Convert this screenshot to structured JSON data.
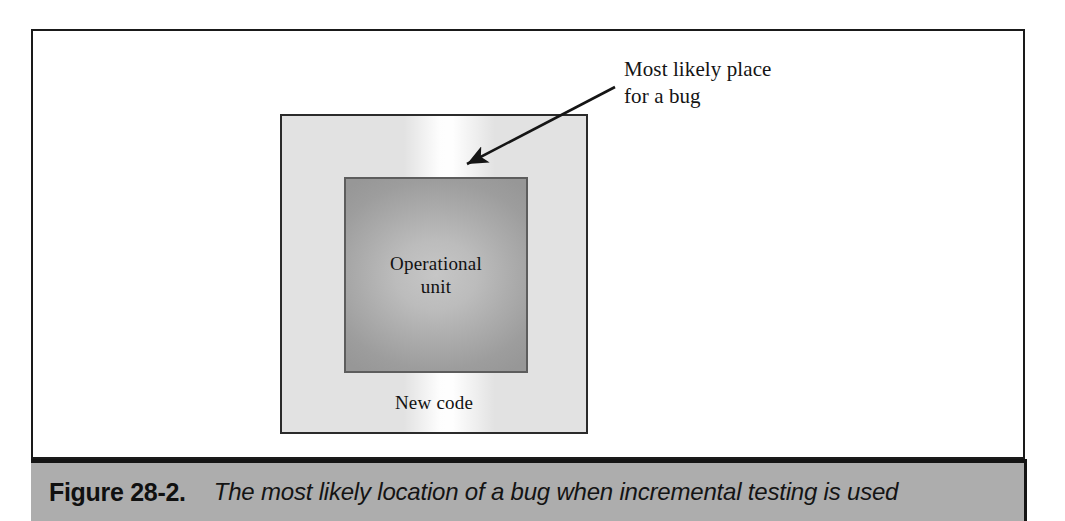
{
  "figure": {
    "caption_number": "Figure 28-2.",
    "caption_text": "The most likely location of a bug when incremental testing is used",
    "caption_bar_color": "#adadad"
  },
  "diagram": {
    "type": "nested-box-callout",
    "outer_box": {
      "label": "New code",
      "fill_color": "#e2e2e2",
      "border_color": "#2b2b2b",
      "highlight": "white vertical band at top center marking the seam between new code and operational unit"
    },
    "inner_box": {
      "label": "Operational\nunit",
      "fill_color": "#ababab",
      "border_color": "#5d5d5d"
    },
    "callout": {
      "text": "Most likely place\nfor a bug",
      "arrow": "arrow pointing down-left from the label to the highlighted seam"
    }
  }
}
